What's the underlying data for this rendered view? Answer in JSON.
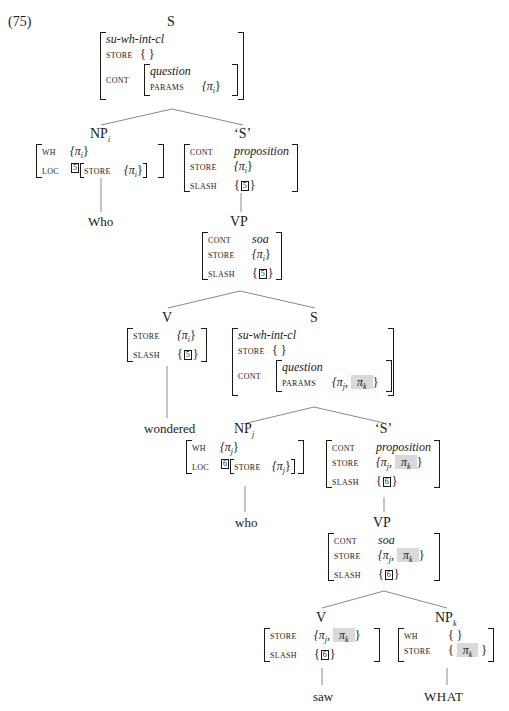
{
  "example_number": "(75)",
  "tree": {
    "root": {
      "label": "S",
      "avm": {
        "type": "su-wh-int-cl",
        "store_feat": "STORE",
        "store_val": "{ }",
        "cont_feat": "CONT",
        "cont_type": "question",
        "params_feat": "PARAMS",
        "params_val": "{π",
        "params_sub": "i",
        "params_close": "}"
      }
    },
    "np_i": {
      "label": "NP",
      "sub": "i",
      "wh_feat": "WH",
      "wh_val": "{π",
      "wh_sub": "i",
      "wh_close": "}",
      "loc_feat": "LOC",
      "loc_tag": "5",
      "store_feat": "STORE",
      "store_val": "{π",
      "store_sub": "i",
      "store_close": "}",
      "leaf": "Who"
    },
    "s_bar_1": {
      "label": "‘S’",
      "cont_feat": "CONT",
      "cont_val": "proposition",
      "store_feat": "STORE",
      "store_val": "{π",
      "store_sub": "i",
      "store_close": "}",
      "slash_feat": "SLASH",
      "slash_tag": "5"
    },
    "vp_1": {
      "label": "VP",
      "cont_feat": "CONT",
      "cont_val": "soa",
      "store_feat": "STORE",
      "store_val": "{π",
      "store_sub": "i",
      "store_close": "}",
      "slash_feat": "SLASH",
      "slash_tag": "5"
    },
    "v_1": {
      "label": "V",
      "store_feat": "STORE",
      "store_val": "{π",
      "store_sub": "i",
      "store_close": "}",
      "slash_feat": "SLASH",
      "slash_tag": "5",
      "leaf": "wondered"
    },
    "s_2": {
      "label": "S",
      "type": "su-wh-int-cl",
      "store_feat": "STORE",
      "store_val": "{ }",
      "cont_feat": "CONT",
      "cont_type": "question",
      "params_feat": "PARAMS",
      "params_val": "{π",
      "params_sub_j": "j",
      "params_k": "π",
      "params_sub_k": "k"
    },
    "np_j": {
      "label": "NP",
      "sub": "j",
      "wh_feat": "WH",
      "wh_val": "{π",
      "wh_sub": "j",
      "wh_close": "}",
      "loc_feat": "LOC",
      "loc_tag": "6",
      "store_feat": "STORE",
      "store_val": "{π",
      "store_sub": "j",
      "store_close": "}",
      "leaf": "who"
    },
    "s_bar_2": {
      "label": "‘S’",
      "cont_feat": "CONT",
      "cont_val": "proposition",
      "store_feat": "STORE",
      "store_val": "{π",
      "store_sub_j": "j",
      "store_k": "π",
      "store_sub_k": "k",
      "slash_feat": "SLASH",
      "slash_tag": "6"
    },
    "vp_2": {
      "label": "VP",
      "cont_feat": "CONT",
      "cont_val": "soa",
      "store_feat": "STORE",
      "store_val": "{π",
      "store_sub_j": "j",
      "store_k": "π",
      "store_sub_k": "k",
      "slash_feat": "SLASH",
      "slash_tag": "6"
    },
    "v_2": {
      "label": "V",
      "store_feat": "STORE",
      "store_val": "{π",
      "store_sub_j": "j",
      "store_k": "π",
      "store_sub_k": "k",
      "slash_feat": "SLASH",
      "slash_tag": "6",
      "leaf": "saw"
    },
    "np_k": {
      "label": "NP",
      "sub": "k",
      "wh_feat": "WH",
      "wh_val": "{ }",
      "store_feat": "STORE",
      "store_k": "π",
      "store_sub_k": "k",
      "leaf": "WHAT"
    }
  },
  "colors": {
    "line": "#8a8a8a",
    "text": "#1a1a1a",
    "highlight": "#d9d9d9"
  }
}
